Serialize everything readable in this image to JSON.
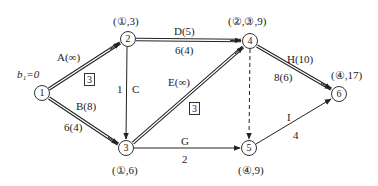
{
  "diagram": {
    "type": "network-flow",
    "nodes": [
      {
        "id": "1",
        "label": "1",
        "x": 42,
        "y": 93,
        "mark": "b₁=0"
      },
      {
        "id": "2",
        "label": "2",
        "x": 128,
        "y": 39,
        "mark": "(①,3)"
      },
      {
        "id": "3",
        "label": "3",
        "x": 126,
        "y": 148,
        "mark": "(①,6)"
      },
      {
        "id": "4",
        "label": "4",
        "x": 250,
        "y": 41,
        "mark": "(②,③,9)"
      },
      {
        "id": "5",
        "label": "5",
        "x": 249,
        "y": 148,
        "mark": "(④,9)"
      },
      {
        "id": "6",
        "label": "6",
        "x": 339,
        "y": 94,
        "mark": "(④,17)"
      }
    ],
    "edges": [
      {
        "from": "1",
        "to": "2",
        "name": "A(∞)",
        "flow": "",
        "boxed": "3",
        "style": "double"
      },
      {
        "from": "1",
        "to": "3",
        "name": "B(8)",
        "flow": "6(4)",
        "style": "double"
      },
      {
        "from": "2",
        "to": "3",
        "name": "C",
        "flow": "1",
        "style": "single"
      },
      {
        "from": "2",
        "to": "4",
        "name": "D(5)",
        "flow": "6(4)",
        "style": "double"
      },
      {
        "from": "3",
        "to": "4",
        "name": "E(∞)",
        "flow": "",
        "boxed": "3",
        "style": "double"
      },
      {
        "from": "3",
        "to": "5",
        "name": "G",
        "flow": "2",
        "style": "single"
      },
      {
        "from": "4",
        "to": "5",
        "name": "",
        "flow": "",
        "style": "dashed"
      },
      {
        "from": "4",
        "to": "6",
        "name": "H(10)",
        "flow": "8(6)",
        "style": "double"
      },
      {
        "from": "5",
        "to": "6",
        "name": "I",
        "flow": "4",
        "style": "single"
      }
    ]
  },
  "labels": {
    "b1": "b₁=0",
    "n1": "1",
    "n2": "2",
    "n3": "3",
    "n4": "4",
    "n5": "5",
    "n6": "6",
    "m2": "(①,3)",
    "m3": "(①,6)",
    "m4": "(②,③,9)",
    "m5": "(④,9)",
    "m6": "(④,17)",
    "eA": "A(∞)",
    "eA_box": "3",
    "eB": "B(8)",
    "eB_flow": "6(4)",
    "eC": "C",
    "eC_flow": "1",
    "eD": "D(5)",
    "eD_flow": "6(4)",
    "eE": "E(∞)",
    "eE_box": "3",
    "eG": "G",
    "eG_flow": "2",
    "eH": "H(10)",
    "eH_flow": "8(6)",
    "eI": "I",
    "eI_flow": "4"
  }
}
